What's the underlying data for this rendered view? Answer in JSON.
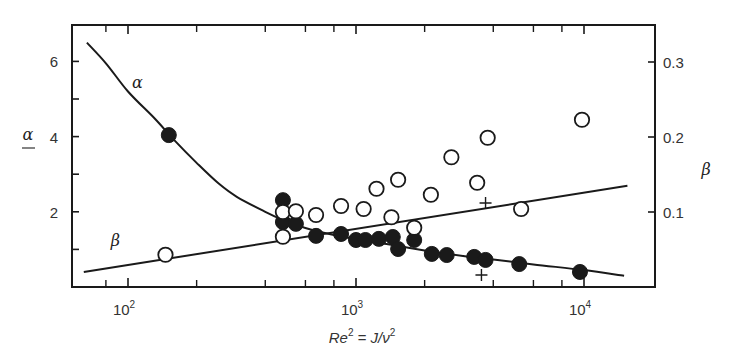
{
  "chart_data": {
    "type": "scatter",
    "title": "",
    "xlabel": "Re² = J/ν²",
    "xlabel_parts": {
      "re": "Re",
      "re_sup": "2",
      "eq": " = J/ν",
      "nu_sup": "2"
    },
    "xscale": "log",
    "xlim": [
      62,
      17500
    ],
    "x_ticks_major": [
      {
        "value": 100,
        "label": "10",
        "sup": "2"
      },
      {
        "value": 1000,
        "label": "10",
        "sup": "3"
      },
      {
        "value": 10000,
        "label": "10",
        "sup": "4"
      }
    ],
    "x_ticks_minor": [
      80,
      200,
      400,
      600,
      800,
      2000,
      4000,
      6000,
      8000
    ],
    "ylabel_left": "α",
    "ylim_left": [
      0,
      6.97
    ],
    "y_ticks_left": [
      {
        "value": 1,
        "label": ""
      },
      {
        "value": 2,
        "label": "2"
      },
      {
        "value": 3,
        "label": ""
      },
      {
        "value": 4,
        "label": "4"
      },
      {
        "value": 5,
        "label": ""
      },
      {
        "value": 6,
        "label": "6"
      }
    ],
    "ylabel_right": "β",
    "ylim_right": [
      0,
      0.349
    ],
    "y_ticks_right": [
      {
        "value": 0.1,
        "label": "0.1"
      },
      {
        "value": 0.2,
        "label": "0.2"
      },
      {
        "value": 0.3,
        "label": "0.3"
      }
    ],
    "grid": false,
    "legend": null,
    "curve_labels": [
      {
        "text": "α",
        "x": 110,
        "y_left": 5.3
      },
      {
        "text": "β",
        "x": 88,
        "y_left": 1.1
      }
    ],
    "series": [
      {
        "name": "α fit curve",
        "kind": "line",
        "axis": "left",
        "points": [
          [
            66,
            6.5
          ],
          [
            80,
            5.95
          ],
          [
            100,
            5.2
          ],
          [
            130,
            4.5
          ],
          [
            160,
            3.9
          ],
          [
            200,
            3.3
          ],
          [
            250,
            2.75
          ],
          [
            300,
            2.4
          ],
          [
            400,
            2.0
          ],
          [
            480,
            1.78
          ],
          [
            600,
            1.57
          ],
          [
            800,
            1.38
          ],
          [
            1000,
            1.27
          ],
          [
            1500,
            1.1
          ],
          [
            2000,
            0.97
          ],
          [
            3000,
            0.82
          ],
          [
            4000,
            0.73
          ],
          [
            6000,
            0.6
          ],
          [
            10000,
            0.45
          ],
          [
            15000,
            0.3
          ]
        ]
      },
      {
        "name": "β fit line",
        "kind": "line",
        "axis": "right",
        "points": [
          [
            64,
            0.02
          ],
          [
            15500,
            0.135
          ]
        ]
      },
      {
        "name": "α (filled circles)",
        "kind": "marker",
        "marker": "filled-circle",
        "axis": "left",
        "points": [
          [
            151,
            4.04
          ],
          [
            478,
            2.31
          ],
          [
            478,
            1.73
          ],
          [
            545,
            1.68
          ],
          [
            668,
            1.36
          ],
          [
            860,
            1.41
          ],
          [
            1000,
            1.25
          ],
          [
            1100,
            1.25
          ],
          [
            1260,
            1.28
          ],
          [
            1450,
            1.33
          ],
          [
            1530,
            1.01
          ],
          [
            1800,
            1.25
          ],
          [
            2150,
            0.88
          ],
          [
            2500,
            0.85
          ],
          [
            3300,
            0.8
          ],
          [
            3700,
            0.72
          ],
          [
            5200,
            0.61
          ],
          [
            9600,
            0.4
          ]
        ]
      },
      {
        "name": "β (open circles)",
        "kind": "marker",
        "marker": "open-circle",
        "axis": "right",
        "points": [
          [
            146,
            0.043
          ],
          [
            478,
            0.1
          ],
          [
            478,
            0.067
          ],
          [
            545,
            0.101
          ],
          [
            668,
            0.096
          ],
          [
            860,
            0.108
          ],
          [
            1080,
            0.104
          ],
          [
            1230,
            0.131
          ],
          [
            1430,
            0.093
          ],
          [
            1530,
            0.143
          ],
          [
            1800,
            0.079
          ],
          [
            2130,
            0.123
          ],
          [
            2620,
            0.173
          ],
          [
            3400,
            0.139
          ],
          [
            3780,
            0.199
          ],
          [
            5300,
            0.104
          ],
          [
            9800,
            0.223
          ]
        ]
      },
      {
        "name": "plus markers",
        "kind": "marker",
        "marker": "plus",
        "axis": "right",
        "points": [
          [
            3700,
            0.112
          ],
          [
            3550,
            0.016
          ]
        ]
      }
    ]
  },
  "layout": {
    "plot": {
      "left": 72,
      "right": 655,
      "top": 25,
      "bottom": 287
    },
    "x_decade_px": 228,
    "x_origin_px": 128,
    "x_origin_log": 2,
    "y_left_px_per_unit": 37.6,
    "y_right_px_per_unit": 750
  },
  "colors": {
    "ink": "#1a1a1a",
    "label": "#333333",
    "background": "#ffffff"
  }
}
